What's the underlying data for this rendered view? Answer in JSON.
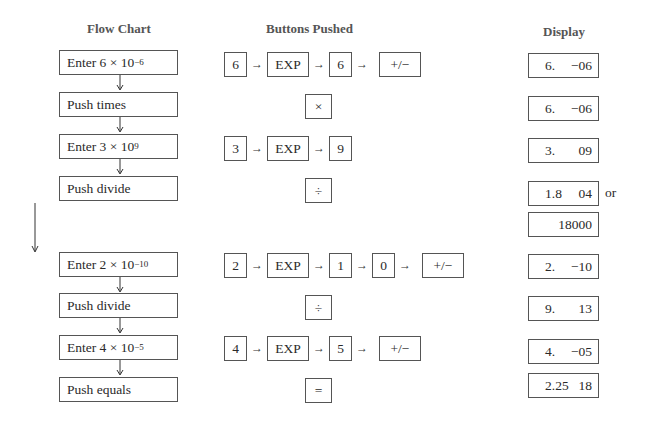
{
  "headers": {
    "flow_chart": "Flow Chart",
    "buttons_pushed": "Buttons Pushed",
    "display": "Display"
  },
  "steps": [
    {
      "flow": {
        "text": "Enter 6 × 10",
        "exp": "−6"
      },
      "buttons": [
        "6",
        "EXP",
        "6",
        "+/−"
      ],
      "display": {
        "mantissa": "6.",
        "exponent": "−06"
      }
    },
    {
      "flow": {
        "text": "Push times",
        "exp": ""
      },
      "buttons": [
        "×"
      ],
      "display": {
        "mantissa": "6.",
        "exponent": "−06"
      }
    },
    {
      "flow": {
        "text": "Enter 3 × 10",
        "exp": "9"
      },
      "buttons": [
        "3",
        "EXP",
        "9"
      ],
      "display": {
        "mantissa": "3.",
        "exponent": "09"
      }
    },
    {
      "flow": {
        "text": "Push divide",
        "exp": ""
      },
      "buttons": [
        "÷"
      ],
      "display": {
        "mantissa": "1.8",
        "exponent": "04"
      },
      "display_alt_label": "or",
      "display_alt": "18000"
    },
    {
      "flow": {
        "text": "Enter 2 × 10",
        "exp": "−10"
      },
      "buttons": [
        "2",
        "EXP",
        "1",
        "0",
        "+/−"
      ],
      "display": {
        "mantissa": "2.",
        "exponent": "−10"
      }
    },
    {
      "flow": {
        "text": "Push divide",
        "exp": ""
      },
      "buttons": [
        "÷"
      ],
      "display": {
        "mantissa": "9.",
        "exponent": "13"
      }
    },
    {
      "flow": {
        "text": "Enter 4 × 10",
        "exp": "−5"
      },
      "buttons": [
        "4",
        "EXP",
        "5",
        "+/−"
      ],
      "display": {
        "mantissa": "4.",
        "exponent": "−05"
      }
    },
    {
      "flow": {
        "text": "Push equals",
        "exp": ""
      },
      "buttons": [
        "="
      ],
      "display": {
        "mantissa": "2.25",
        "exponent": "18"
      }
    }
  ],
  "arrows": {
    "right": "→",
    "down": "↓"
  }
}
